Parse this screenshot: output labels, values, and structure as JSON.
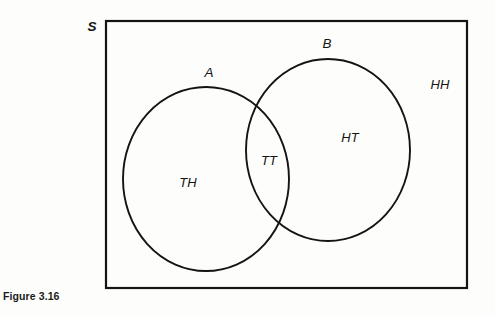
{
  "figure": {
    "caption": "Figure 3.16",
    "background_color": "#fdfdfc",
    "stroke_color": "#141414"
  },
  "diagram": {
    "type": "venn",
    "universe": {
      "label": "S",
      "shape": "rectangle",
      "x": 106,
      "y": 21,
      "width": 361,
      "height": 267,
      "label_x": 92,
      "label_y": 27
    },
    "sets": [
      {
        "name": "set-a",
        "label": "A",
        "cx": 206,
        "cy": 179,
        "rx": 83,
        "ry": 92,
        "label_x": 209,
        "label_y": 73
      },
      {
        "name": "set-b",
        "label": "B",
        "cx": 328,
        "cy": 150,
        "rx": 82,
        "ry": 91,
        "label_x": 327,
        "label_y": 44
      }
    ],
    "regions": [
      {
        "name": "region-a-only",
        "label": "TH",
        "membership": "A only",
        "x": 188,
        "y": 184
      },
      {
        "name": "region-a-and-b",
        "label": "TT",
        "membership": "A and B",
        "x": 269,
        "y": 162
      },
      {
        "name": "region-b-only",
        "label": "HT",
        "membership": "B only",
        "x": 350,
        "y": 139
      },
      {
        "name": "region-outside",
        "label": "HH",
        "membership": "neither A nor B",
        "x": 440,
        "y": 86
      }
    ]
  }
}
